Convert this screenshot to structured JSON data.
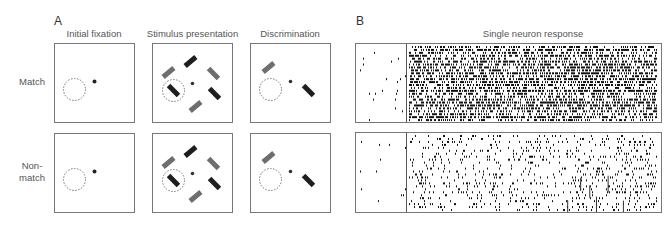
{
  "panel_a": {
    "letter": "A",
    "columns": [
      "Initial fixation",
      "Stimulus presentation",
      "Discrimination"
    ],
    "rows": [
      {
        "label": "Match"
      },
      {
        "label": "Non-\nmatch"
      }
    ],
    "colors": {
      "gray_bar": "#6e6e6e",
      "dark_bar": "#1e1e1e",
      "fixation_dot": "#222222",
      "frame": "#777777",
      "dashed_circle": "#666666"
    }
  },
  "panel_b": {
    "letter": "B",
    "title": "Single neuron response",
    "rows": [
      "match",
      "non-match"
    ],
    "stimulus_onset_marker": "vertical line"
  }
}
